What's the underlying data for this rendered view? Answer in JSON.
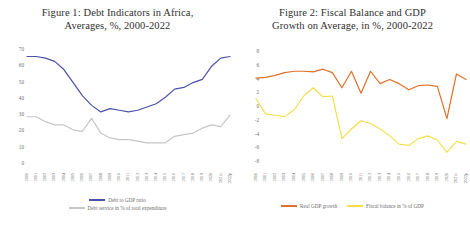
{
  "figures": [
    {
      "title_line1": "Figure 1: Debt Indicators in Africa,",
      "title_line2": "Averages, %, 2000-2022"
    },
    {
      "title_line1": "Figure 2: Fiscal Balance and GDP",
      "title_line2": "Growth on Average, in %, 2000-2022"
    }
  ],
  "chart_data": [
    {
      "type": "line",
      "title": "Figure 1: Debt Indicators in Africa, Averages, %, 2000-2022",
      "xlabel": "",
      "ylabel": "",
      "grid": false,
      "legend_position": "bottom",
      "ylim": [
        0,
        70
      ],
      "yticks": [
        70,
        60,
        50,
        40,
        30,
        20,
        10,
        0
      ],
      "categories": [
        "2000",
        "2001",
        "2002",
        "2003",
        "2004",
        "2005",
        "2006",
        "2007",
        "2008",
        "2009",
        "2010",
        "2011",
        "2012",
        "2013",
        "2014",
        "2015",
        "2016",
        "2017",
        "2018",
        "2019",
        "2020",
        "2021e",
        "2022p"
      ],
      "series": [
        {
          "name": "Debt to GDP ratio",
          "color": "#4c51a8",
          "values": [
            66,
            66,
            65,
            63,
            58,
            50,
            42,
            36,
            32,
            34,
            33,
            32,
            33,
            35,
            37,
            41,
            46,
            47,
            50,
            52,
            60,
            65,
            66
          ]
        },
        {
          "name": "Debt service in % of total expenditure",
          "color": "#c6c6c6",
          "values": [
            29,
            29,
            26,
            24,
            24,
            21,
            20,
            28,
            19,
            16,
            15,
            15,
            14,
            13,
            13,
            13,
            17,
            18,
            19,
            22,
            24,
            23,
            30
          ]
        }
      ]
    },
    {
      "type": "line",
      "title": "Figure 2: Fiscal Balance and GDP Growth on Average, in %, 2000-2022",
      "xlabel": "",
      "ylabel": "",
      "grid": false,
      "legend_position": "bottom",
      "ylim": [
        -8,
        8
      ],
      "yticks": [
        8,
        6,
        4,
        2,
        0,
        -2,
        -4,
        -6,
        -8
      ],
      "categories": [
        "2000",
        "2001",
        "2002",
        "2003",
        "2004",
        "2005",
        "2006",
        "2007",
        "2008",
        "2009",
        "2010",
        "2011",
        "2012",
        "2013",
        "2014",
        "2015",
        "2016",
        "2017",
        "2018",
        "2019",
        "2020",
        "2021e",
        "2022p"
      ],
      "series": [
        {
          "name": "Real GDP growth",
          "color": "#e2702a",
          "values": [
            4.2,
            4.3,
            4.6,
            5.0,
            5.2,
            5.2,
            5.1,
            5.5,
            5.0,
            2.8,
            5.2,
            2.0,
            5.2,
            3.4,
            4.0,
            3.4,
            2.5,
            3.1,
            3.2,
            3.0,
            -1.7,
            4.8,
            4.0
          ]
        },
        {
          "name": "Fiscal balance in % of GDP",
          "color": "#f5df4b",
          "values": [
            1.2,
            -1.0,
            -1.2,
            -1.4,
            -0.4,
            1.6,
            2.8,
            1.5,
            1.6,
            -4.6,
            -3.2,
            -2.0,
            -2.4,
            -3.2,
            -4.2,
            -5.4,
            -5.6,
            -4.6,
            -4.2,
            -4.8,
            -6.6,
            -5.0,
            -5.4
          ]
        }
      ]
    }
  ]
}
